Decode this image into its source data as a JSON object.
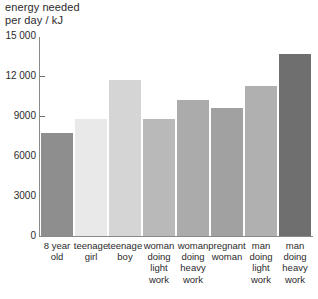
{
  "chart_data": {
    "type": "bar",
    "title": "energy needed\nper day / kJ",
    "xlabel": "",
    "ylabel": "energy needed per day / kJ",
    "ylim": [
      0,
      15000
    ],
    "yticks": [
      0,
      3000,
      6000,
      9000,
      12000,
      15000
    ],
    "ytick_labels": [
      "0",
      "3000",
      "6000",
      "9000",
      "12 000",
      "15 000"
    ],
    "grid": false,
    "legend": "none",
    "categories": [
      "8 year\nold",
      "teenage\ngirl",
      "teenage\nboy",
      "woman\ndoing\nlight\nwork",
      "woman\ndoing\nheavy\nwork",
      "pregnant\nwoman",
      "man\ndoing\nlight\nwork",
      "man\ndoing\nheavy\nwork"
    ],
    "values": [
      7800,
      8850,
      11800,
      8850,
      10300,
      9700,
      11300,
      13700
    ],
    "bar_colors": [
      "#8e8e8e",
      "#e9e9e9",
      "#d5d5d5",
      "#b9b9b9",
      "#ababab",
      "#a1a1a1",
      "#b0b0b0",
      "#6f6f6f"
    ],
    "axis_color": "#8a8a8a",
    "text_color": "#2b2b2b",
    "background_color": "#ffffff"
  }
}
